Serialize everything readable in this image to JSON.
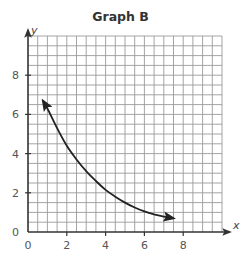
{
  "chart_data": {
    "type": "line",
    "title": "Graph B",
    "xlabel": "x",
    "ylabel": "y",
    "xlim": [
      0,
      10
    ],
    "ylim": [
      0,
      10
    ],
    "grid": true,
    "grid_step": 0.5,
    "x_ticks": [
      0,
      2,
      4,
      6,
      8
    ],
    "y_ticks": [
      0,
      2,
      4,
      6,
      8
    ],
    "x_tick_labels": [
      "0",
      "2",
      "4",
      "6",
      "8"
    ],
    "y_tick_labels": [
      "0",
      "2",
      "4",
      "6",
      "8"
    ],
    "legend": null,
    "series": [
      {
        "name": "curve",
        "arrows_both_ends": true,
        "x": [
          0.77,
          1.0,
          1.5,
          2.0,
          2.5,
          3.0,
          3.5,
          4.0,
          4.5,
          5.0,
          5.5,
          6.0,
          6.5,
          7.0,
          7.5
        ],
        "y": [
          6.7,
          6.3,
          5.3,
          4.4,
          3.7,
          3.1,
          2.6,
          2.15,
          1.8,
          1.5,
          1.25,
          1.05,
          0.9,
          0.78,
          0.7
        ]
      }
    ]
  }
}
